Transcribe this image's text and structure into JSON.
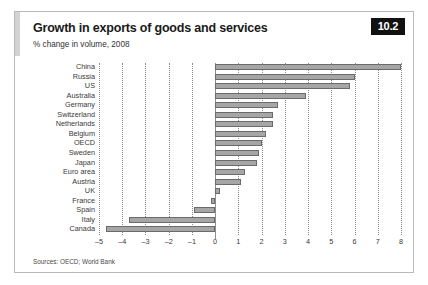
{
  "figure": {
    "badge": "10.2",
    "title": "Growth in exports of goods and services",
    "subtitle": "% change in volume, 2008",
    "source": "Sources: OECD; World Bank"
  },
  "chart_data": {
    "type": "bar",
    "orientation": "horizontal",
    "title": "Growth in exports of goods and services",
    "subtitle": "% change in volume, 2008",
    "xlabel": "",
    "ylabel": "",
    "xlim": [
      -5,
      8
    ],
    "grid": true,
    "legend": false,
    "xticks": [
      "–5",
      "–4",
      "–3",
      "–2",
      "–1",
      "0",
      "1",
      "2",
      "3",
      "4",
      "5",
      "6",
      "7",
      "8"
    ],
    "xtick_values": [
      -5,
      -4,
      -3,
      -2,
      -1,
      0,
      1,
      2,
      3,
      4,
      5,
      6,
      7,
      8
    ],
    "categories": [
      "China",
      "Russia",
      "US",
      "Australia",
      "Germany",
      "Switzerland",
      "Netherlands",
      "Belgium",
      "OECD",
      "Sweden",
      "Japan",
      "Euro area",
      "Austria",
      "UK",
      "France",
      "Spain",
      "Italy",
      "Canada"
    ],
    "values": [
      8.0,
      6.0,
      5.8,
      3.9,
      2.7,
      2.5,
      2.5,
      2.2,
      2.0,
      1.9,
      1.8,
      1.3,
      1.1,
      0.2,
      -0.2,
      -0.9,
      -3.7,
      -4.7
    ],
    "bar_color": "#a6a6a6",
    "bar_edge_color": "#6b6b6b"
  }
}
